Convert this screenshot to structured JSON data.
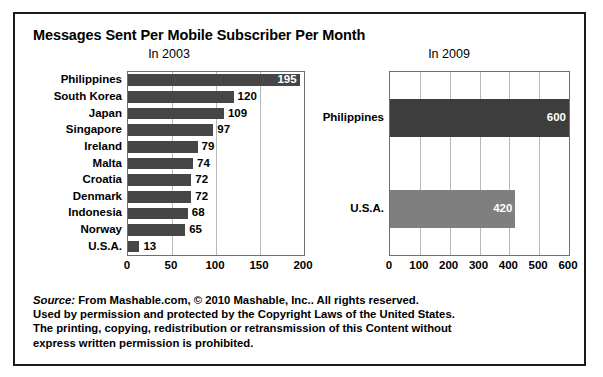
{
  "figure": {
    "title": "Messages Sent Per Mobile Subscriber Per Month",
    "border_color": "#1a1a1a",
    "background": "#ffffff"
  },
  "source_note": {
    "label": "Source:",
    "lines": [
      "From Mashable.com, © 2010 Mashable, Inc.. All rights reserved.",
      "Used by permission and protected by the Copyright Laws of the United States.",
      "The printing, copying, redistribution or retransmission of this Content without",
      "express written permission is prohibited."
    ]
  },
  "chart_data": [
    {
      "type": "bar",
      "orientation": "horizontal",
      "title": "In 2003",
      "xlabel": "",
      "ylabel": "",
      "categories": [
        "Philippines",
        "South Korea",
        "Japan",
        "Singapore",
        "Ireland",
        "Malta",
        "Croatia",
        "Denmark",
        "Indonesia",
        "Norway",
        "U.S.A."
      ],
      "values": [
        195,
        120,
        109,
        97,
        79,
        74,
        72,
        72,
        68,
        65,
        13
      ],
      "value_labels": [
        "195",
        "120",
        "109",
        "97",
        "79",
        "74",
        "72",
        "72",
        "68",
        "65",
        "13"
      ],
      "label_placement": [
        "inside",
        "outside",
        "outside",
        "outside",
        "outside",
        "outside",
        "outside",
        "outside",
        "outside",
        "outside",
        "outside"
      ],
      "xlim": [
        0,
        200
      ],
      "xticks": [
        0,
        50,
        100,
        150,
        200
      ],
      "xtick_labels": [
        "0",
        "50",
        "100",
        "150",
        "200"
      ],
      "grid": true,
      "bar_color": "#464646",
      "legend": "none"
    },
    {
      "type": "bar",
      "orientation": "horizontal",
      "title": "In 2009",
      "xlabel": "",
      "ylabel": "",
      "categories": [
        "Philippines",
        "U.S.A."
      ],
      "values": [
        600,
        420
      ],
      "value_labels": [
        "600",
        "420"
      ],
      "label_placement": [
        "inside",
        "inside"
      ],
      "bar_colors": [
        "#3d3d3d",
        "#7f7f7f"
      ],
      "xlim": [
        0,
        600
      ],
      "xticks": [
        0,
        100,
        200,
        300,
        400,
        500,
        600
      ],
      "xtick_labels": [
        "0",
        "100",
        "200",
        "300",
        "400",
        "500",
        "600"
      ],
      "grid": true,
      "legend": "none"
    }
  ]
}
